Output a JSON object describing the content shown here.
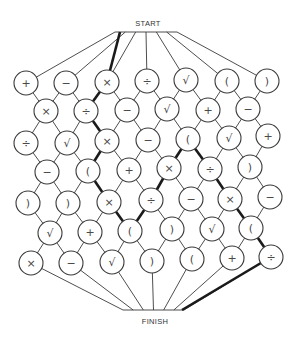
{
  "diagram": {
    "start_label": "START",
    "finish_label": "FINISH",
    "start": {
      "x": 148,
      "y": 23,
      "bar": [
        115,
        177
      ],
      "bar_y": 32
    },
    "finish": {
      "x": 155,
      "y": 321,
      "bar": [
        123,
        184
      ],
      "bar_y": 310
    },
    "node_radius": 12,
    "rows": [
      {
        "nodes": [
          {
            "sym": "+",
            "x": 26,
            "y": 83
          },
          {
            "sym": "−",
            "x": 66,
            "y": 83
          },
          {
            "sym": "×",
            "x": 107,
            "y": 82
          },
          {
            "sym": "÷",
            "x": 147,
            "y": 81
          },
          {
            "sym": "√",
            "x": 186,
            "y": 80
          },
          {
            "sym": "(",
            "x": 227,
            "y": 81
          },
          {
            "sym": ")",
            "x": 267,
            "y": 81
          }
        ]
      },
      {
        "nodes": [
          {
            "sym": "×",
            "x": 46,
            "y": 111
          },
          {
            "sym": "÷",
            "x": 86,
            "y": 111
          },
          {
            "sym": "−",
            "x": 127,
            "y": 110
          },
          {
            "sym": "√",
            "x": 167,
            "y": 109
          },
          {
            "sym": "+",
            "x": 208,
            "y": 110
          },
          {
            "sym": "−",
            "x": 248,
            "y": 109
          }
        ]
      },
      {
        "nodes": [
          {
            "sym": "÷",
            "x": 26,
            "y": 143
          },
          {
            "sym": "√",
            "x": 67,
            "y": 143
          },
          {
            "sym": "×",
            "x": 107,
            "y": 141
          },
          {
            "sym": "−",
            "x": 148,
            "y": 140
          },
          {
            "sym": "(",
            "x": 188,
            "y": 139
          },
          {
            "sym": "√",
            "x": 229,
            "y": 138
          },
          {
            "sym": "+",
            "x": 268,
            "y": 136
          }
        ]
      },
      {
        "nodes": [
          {
            "sym": "−",
            "x": 47,
            "y": 172
          },
          {
            "sym": "(",
            "x": 88,
            "y": 171
          },
          {
            "sym": "+",
            "x": 129,
            "y": 170
          },
          {
            "sym": "×",
            "x": 169,
            "y": 168
          },
          {
            "sym": "÷",
            "x": 210,
            "y": 169
          },
          {
            "sym": ")",
            "x": 250,
            "y": 167
          }
        ]
      },
      {
        "nodes": [
          {
            "sym": ")",
            "x": 28,
            "y": 203
          },
          {
            "sym": ")",
            "x": 68,
            "y": 203
          },
          {
            "sym": "×",
            "x": 109,
            "y": 202
          },
          {
            "sym": "÷",
            "x": 151,
            "y": 200
          },
          {
            "sym": "−",
            "x": 191,
            "y": 199
          },
          {
            "sym": "×",
            "x": 230,
            "y": 199
          },
          {
            "sym": "−",
            "x": 270,
            "y": 197
          }
        ]
      },
      {
        "nodes": [
          {
            "sym": "√",
            "x": 50,
            "y": 233
          },
          {
            "sym": "+",
            "x": 90,
            "y": 232
          },
          {
            "sym": "(",
            "x": 130,
            "y": 231
          },
          {
            "sym": ")",
            "x": 172,
            "y": 229
          },
          {
            "sym": "√",
            "x": 212,
            "y": 229
          },
          {
            "sym": "(",
            "x": 251,
            "y": 228
          }
        ]
      },
      {
        "nodes": [
          {
            "sym": "×",
            "x": 31,
            "y": 263
          },
          {
            "sym": "−",
            "x": 71,
            "y": 263
          },
          {
            "sym": "√",
            "x": 112,
            "y": 262
          },
          {
            "sym": ")",
            "x": 152,
            "y": 261
          },
          {
            "sym": "(",
            "x": 192,
            "y": 259
          },
          {
            "sym": "+",
            "x": 232,
            "y": 258
          },
          {
            "sym": "÷",
            "x": 271,
            "y": 257
          }
        ]
      }
    ],
    "bold_path": [
      [
        "start",
        null
      ],
      [
        0,
        2
      ],
      [
        1,
        1
      ],
      [
        2,
        2
      ],
      [
        3,
        1
      ],
      [
        4,
        2
      ],
      [
        5,
        2
      ],
      [
        4,
        3
      ],
      [
        3,
        3
      ],
      [
        2,
        4
      ],
      [
        3,
        4
      ],
      [
        4,
        5
      ],
      [
        5,
        5
      ],
      [
        6,
        6
      ],
      [
        "finish",
        null
      ]
    ]
  }
}
